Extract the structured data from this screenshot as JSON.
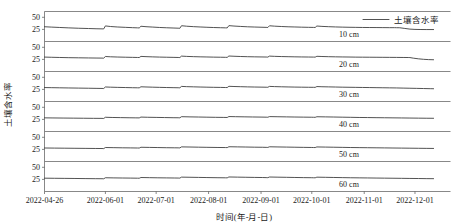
{
  "chart_data": {
    "type": "line",
    "title": "",
    "xlabel": "时间(年-月-日)",
    "ylabel": "土壤含水率",
    "legend": [
      {
        "name": "土壤含水率",
        "color": "#333333"
      }
    ],
    "legend_position": "top-right",
    "grid": false,
    "layout": "stacked-subplots",
    "panel_count": 6,
    "ylim": [
      0,
      62
    ],
    "yticks": [
      25,
      50
    ],
    "ytick_labels": [
      "25",
      "50"
    ],
    "x_tick_labels": [
      "2022-04-26",
      "2022-06-01",
      "2022-07-01",
      "2022-08-01",
      "2022-09-01",
      "2022-10-01",
      "2022-11-01",
      "2022-12-01"
    ],
    "x_tick_positions_days": [
      0,
      36,
      66,
      97,
      128,
      158,
      189,
      219
    ],
    "x_range_days": [
      0,
      240
    ],
    "panels": [
      {
        "label": "10 cm",
        "series_name": "土壤含水率",
        "x": [
          0,
          4,
          9,
          14,
          20,
          26,
          31,
          34,
          35,
          36,
          39,
          43,
          48,
          52,
          55,
          56,
          57,
          60,
          64,
          68,
          72,
          76,
          79,
          80,
          81,
          84,
          88,
          92,
          96,
          100,
          104,
          107,
          108,
          109,
          112,
          116,
          120,
          124,
          128,
          131,
          132,
          133,
          136,
          140,
          144,
          148,
          152,
          156,
          159,
          160,
          161,
          164,
          168,
          172,
          176,
          180,
          184,
          188,
          192,
          196,
          200,
          204,
          206,
          207,
          208,
          210,
          213,
          216,
          219,
          222,
          226,
          230
        ],
        "y": [
          30.5,
          29.8,
          29.0,
          28.2,
          27.4,
          26.8,
          26.3,
          26.1,
          26.0,
          32.2,
          31.0,
          30.0,
          29.2,
          28.6,
          28.2,
          28.0,
          31.5,
          30.6,
          29.8,
          29.0,
          28.4,
          27.9,
          27.5,
          27.3,
          32.6,
          31.6,
          30.7,
          30.0,
          29.4,
          28.9,
          28.5,
          28.2,
          28.1,
          32.8,
          31.9,
          31.1,
          30.4,
          29.9,
          29.5,
          29.2,
          29.0,
          32.5,
          31.7,
          31.0,
          30.4,
          30.0,
          29.6,
          29.3,
          29.1,
          29.0,
          32.0,
          31.2,
          30.6,
          30.1,
          29.7,
          29.4,
          29.2,
          29.0,
          28.9,
          28.8,
          28.7,
          28.6,
          28.6,
          28.6,
          28.5,
          28.4,
          27.0,
          25.6,
          25.0,
          24.8,
          24.7,
          24.7
        ]
      },
      {
        "label": "20 cm",
        "series_name": "土壤含水率",
        "x": [
          0,
          4,
          9,
          14,
          20,
          26,
          31,
          34,
          35,
          36,
          39,
          43,
          48,
          52,
          55,
          56,
          57,
          60,
          64,
          68,
          72,
          76,
          79,
          80,
          81,
          84,
          88,
          92,
          96,
          100,
          104,
          107,
          108,
          109,
          112,
          116,
          120,
          124,
          128,
          131,
          132,
          133,
          136,
          140,
          144,
          148,
          152,
          156,
          159,
          160,
          161,
          164,
          168,
          172,
          176,
          180,
          184,
          188,
          192,
          196,
          200,
          204,
          208,
          212,
          215,
          216,
          218,
          221,
          224,
          227,
          230
        ],
        "y": [
          29.8,
          29.4,
          29.0,
          28.6,
          28.3,
          28.0,
          27.8,
          27.7,
          27.6,
          31.0,
          30.4,
          29.9,
          29.5,
          29.2,
          29.0,
          28.9,
          31.2,
          30.7,
          30.2,
          29.8,
          29.5,
          29.2,
          29.0,
          28.9,
          31.8,
          31.2,
          30.7,
          30.3,
          30.0,
          29.7,
          29.5,
          29.3,
          29.2,
          32.0,
          31.5,
          31.0,
          30.6,
          30.3,
          30.1,
          29.9,
          29.8,
          31.8,
          31.3,
          30.9,
          30.6,
          30.3,
          30.1,
          29.9,
          29.8,
          29.7,
          31.4,
          31.0,
          30.6,
          30.3,
          30.1,
          29.9,
          29.7,
          29.6,
          29.5,
          29.4,
          29.3,
          29.2,
          29.1,
          29.0,
          28.9,
          28.8,
          27.6,
          26.2,
          25.2,
          24.6,
          24.3
        ]
      },
      {
        "label": "30 cm",
        "series_name": "土壤含水率",
        "x": [
          0,
          4,
          9,
          14,
          20,
          26,
          31,
          34,
          35,
          36,
          39,
          43,
          48,
          52,
          55,
          56,
          57,
          60,
          64,
          68,
          72,
          76,
          79,
          80,
          81,
          84,
          88,
          92,
          96,
          100,
          104,
          107,
          108,
          109,
          112,
          116,
          120,
          124,
          128,
          131,
          132,
          133,
          136,
          140,
          144,
          148,
          152,
          156,
          159,
          160,
          161,
          164,
          168,
          172,
          176,
          180,
          184,
          188,
          192,
          196,
          200,
          204,
          208,
          212,
          216,
          220,
          224,
          228,
          230
        ],
        "y": [
          28.8,
          28.6,
          28.3,
          28.0,
          27.7,
          27.4,
          27.1,
          27.0,
          26.9,
          30.0,
          29.6,
          29.2,
          28.8,
          28.5,
          28.3,
          28.2,
          30.4,
          30.0,
          29.6,
          29.2,
          28.9,
          28.6,
          28.4,
          28.3,
          31.2,
          30.7,
          30.3,
          29.9,
          29.6,
          29.3,
          29.1,
          28.9,
          28.8,
          31.4,
          31.0,
          30.6,
          30.2,
          29.9,
          29.7,
          29.5,
          29.4,
          31.2,
          30.8,
          30.4,
          30.1,
          29.8,
          29.6,
          29.4,
          29.3,
          29.2,
          30.9,
          30.5,
          30.2,
          29.9,
          29.6,
          29.4,
          29.2,
          29.0,
          28.8,
          28.6,
          28.4,
          28.2,
          28.0,
          27.7,
          27.4,
          27.1,
          26.8,
          26.5,
          26.4
        ]
      },
      {
        "label": "40 cm",
        "series_name": "土壤含水率",
        "x": [
          0,
          5,
          11,
          17,
          23,
          29,
          34,
          35,
          36,
          40,
          45,
          50,
          54,
          56,
          57,
          61,
          66,
          71,
          76,
          79,
          80,
          81,
          86,
          91,
          96,
          101,
          106,
          108,
          109,
          113,
          118,
          123,
          128,
          131,
          132,
          133,
          138,
          143,
          148,
          153,
          158,
          159,
          160,
          161,
          166,
          171,
          176,
          181,
          186,
          191,
          196,
          201,
          206,
          211,
          216,
          221,
          226,
          230
        ],
        "y": [
          28.2,
          28.0,
          27.8,
          27.6,
          27.4,
          27.2,
          27.1,
          27.0,
          29.4,
          29.0,
          28.7,
          28.4,
          28.2,
          28.1,
          29.8,
          29.4,
          29.1,
          28.8,
          28.5,
          28.4,
          28.3,
          30.6,
          30.2,
          29.9,
          29.6,
          29.3,
          29.1,
          29.0,
          30.9,
          30.6,
          30.3,
          30.0,
          29.8,
          29.6,
          29.5,
          30.8,
          30.5,
          30.2,
          29.9,
          29.7,
          29.5,
          29.4,
          29.3,
          30.5,
          30.2,
          29.9,
          29.6,
          29.3,
          29.0,
          28.8,
          28.6,
          28.4,
          28.2,
          28.0,
          27.8,
          27.6,
          27.4,
          27.3
        ]
      },
      {
        "label": "50 cm",
        "series_name": "土壤含水率",
        "x": [
          0,
          6,
          12,
          18,
          24,
          30,
          34,
          35,
          36,
          41,
          46,
          51,
          55,
          56,
          57,
          62,
          67,
          72,
          77,
          79,
          80,
          81,
          86,
          91,
          96,
          102,
          107,
          108,
          109,
          114,
          119,
          124,
          129,
          131,
          132,
          133,
          138,
          143,
          148,
          153,
          158,
          159,
          160,
          161,
          166,
          171,
          176,
          181,
          186,
          191,
          196,
          201,
          206,
          211,
          216,
          221,
          226,
          230
        ],
        "y": [
          27.9,
          27.7,
          27.5,
          27.3,
          27.1,
          26.9,
          26.8,
          26.7,
          28.9,
          28.6,
          28.3,
          28.1,
          27.9,
          27.8,
          29.4,
          29.1,
          28.8,
          28.5,
          28.3,
          28.2,
          28.1,
          30.2,
          29.9,
          29.6,
          29.3,
          29.0,
          28.8,
          28.7,
          30.5,
          30.2,
          29.9,
          29.6,
          29.4,
          29.2,
          29.1,
          30.4,
          30.1,
          29.8,
          29.5,
          29.2,
          29.0,
          28.9,
          28.8,
          30.1,
          29.8,
          29.5,
          29.2,
          28.9,
          28.7,
          28.5,
          28.3,
          28.1,
          27.9,
          27.7,
          27.5,
          27.3,
          27.1,
          27.0
        ]
      },
      {
        "label": "60 cm",
        "series_name": "土壤含水率",
        "x": [
          0,
          6,
          12,
          18,
          24,
          30,
          34,
          35,
          36,
          41,
          46,
          51,
          55,
          56,
          57,
          62,
          67,
          72,
          77,
          79,
          80,
          81,
          86,
          91,
          96,
          102,
          107,
          108,
          109,
          114,
          119,
          124,
          129,
          131,
          132,
          133,
          138,
          143,
          148,
          153,
          158,
          159,
          160,
          161,
          166,
          171,
          176,
          181,
          186,
          191,
          196,
          201,
          206,
          211,
          216,
          221,
          226,
          230
        ],
        "y": [
          27.5,
          27.3,
          27.1,
          26.9,
          26.7,
          26.5,
          26.4,
          26.3,
          28.4,
          28.1,
          27.9,
          27.7,
          27.5,
          27.4,
          28.9,
          28.6,
          28.3,
          28.1,
          27.9,
          27.8,
          27.7,
          29.7,
          29.4,
          29.1,
          28.8,
          28.5,
          28.3,
          28.2,
          30.0,
          29.7,
          29.4,
          29.1,
          28.9,
          28.7,
          28.6,
          29.9,
          29.6,
          29.3,
          29.0,
          28.7,
          28.5,
          28.4,
          28.3,
          29.6,
          29.3,
          29.0,
          28.7,
          28.4,
          28.2,
          28.0,
          27.8,
          27.6,
          27.4,
          27.2,
          27.0,
          26.8,
          26.6,
          26.5
        ]
      }
    ]
  }
}
